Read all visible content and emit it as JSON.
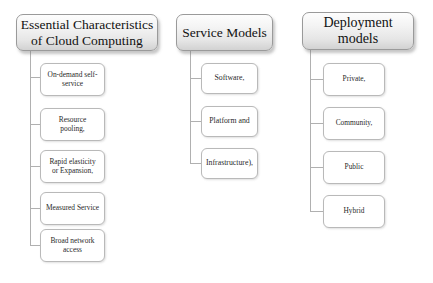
{
  "diagram": {
    "type": "tree",
    "background_color": "#ffffff",
    "accent_border_color": "#9a9a9a",
    "leaf_border_color": "#b9b9b9",
    "connector_color": "#b0b0b0",
    "columns": [
      {
        "id": "essential-characteristics",
        "root": {
          "label": "Essential Characteristics of Cloud Computing",
          "line1": "Essential Characteristics",
          "line2": "of Cloud Computing"
        },
        "children": [
          {
            "label": "On-demand self-service",
            "line1": "On-demand self-",
            "line2": "service"
          },
          {
            "label": "Resource pooling,",
            "line1": "Resource",
            "line2": "pooling,"
          },
          {
            "label": "Rapid elasticity or Expansion,",
            "line1": "Rapid elasticity",
            "line2": "or Expansion,"
          },
          {
            "label": "Measured Service",
            "line1": "Measured Service",
            "line2": ""
          },
          {
            "label": "Broad network access",
            "line1": "Broad network",
            "line2": "access"
          }
        ]
      },
      {
        "id": "service-models",
        "root": {
          "label": "Service Models",
          "line1": "Service Models",
          "line2": ""
        },
        "children": [
          {
            "label": "Software,",
            "line1": "Software,",
            "line2": ""
          },
          {
            "label": "Platform and",
            "line1": "Platform and",
            "line2": ""
          },
          {
            "label": "Infrastructure),",
            "line1": "Infrastructure),",
            "line2": ""
          }
        ]
      },
      {
        "id": "deployment-models",
        "root": {
          "label": "Deployment models",
          "line1": "Deployment",
          "line2": "models"
        },
        "children": [
          {
            "label": "Private,",
            "line1": "Private,",
            "line2": ""
          },
          {
            "label": "Community,",
            "line1": "Community,",
            "line2": ""
          },
          {
            "label": "Public",
            "line1": "Public",
            "line2": ""
          },
          {
            "label": "Hybrid",
            "line1": "Hybrid",
            "line2": ""
          }
        ]
      }
    ]
  }
}
